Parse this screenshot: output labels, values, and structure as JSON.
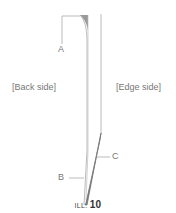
{
  "labels": {
    "a": "A",
    "b": "B",
    "c": "C",
    "back_side": "[Back side]",
    "edge_side": "[Edge side]"
  },
  "caption": {
    "prefix": "ILL.",
    "number": "10"
  },
  "colors": {
    "line": "#999999",
    "shade": "#888888",
    "text": "#777777"
  }
}
